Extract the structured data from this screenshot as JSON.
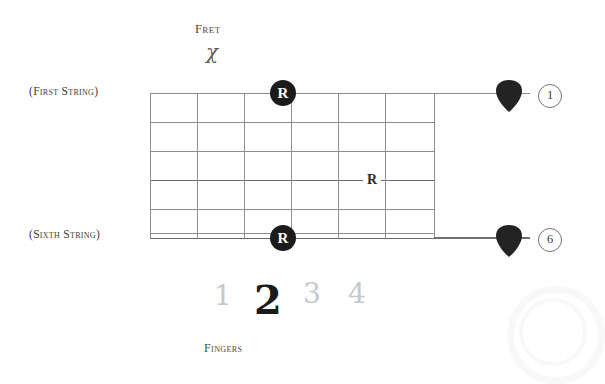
{
  "diagram": {
    "title_label": "Fret",
    "fret_symbol": "χ",
    "fingers_label": "Fingers",
    "first_string_label": "(First String)",
    "sixth_string_label": "(Sixth String)",
    "grid": {
      "string_count": 6,
      "fret_count": 6,
      "string_rows_y": [
        93,
        122,
        151,
        180,
        209,
        238
      ],
      "fret_cols_x": [
        150,
        197,
        244,
        291,
        338,
        385,
        434
      ]
    },
    "markers": [
      {
        "name": "root-marker-top",
        "label": "R",
        "style": "filled-circle",
        "string": 1,
        "fret_x": 283,
        "y": 93
      },
      {
        "name": "root-marker-middle",
        "label": "R",
        "style": "plain-text",
        "string": 4,
        "fret_x": 372,
        "y": 180
      },
      {
        "name": "root-marker-bottom",
        "label": "R",
        "style": "filled-circle",
        "string": 6,
        "fret_x": 283,
        "y": 238
      }
    ],
    "picks": [
      {
        "name": "pick-first-string",
        "x": 494,
        "y": 79
      },
      {
        "name": "pick-sixth-string",
        "x": 494,
        "y": 224
      }
    ],
    "string_numbers": [
      {
        "name": "string-number-1",
        "value": "1",
        "x": 538,
        "y": 84
      },
      {
        "name": "string-number-6",
        "value": "6",
        "x": 538,
        "y": 228
      }
    ],
    "fingers": [
      {
        "name": "finger-1",
        "value": "1",
        "state": "dim",
        "x": 214,
        "y": 279
      },
      {
        "name": "finger-2",
        "value": "2",
        "state": "active",
        "x": 254,
        "y": 276
      },
      {
        "name": "finger-3",
        "value": "3",
        "state": "dim",
        "x": 303,
        "y": 277
      },
      {
        "name": "finger-4",
        "value": "4",
        "state": "dim",
        "x": 348,
        "y": 277
      }
    ],
    "colors": {
      "line": "#8d8d8d",
      "marker_fill": "#1b1b1b",
      "marker_text": "#ffffff",
      "finger_dim": "#c3c8cf",
      "finger_active": "#1a1a1a",
      "background": "#ffffff"
    }
  }
}
